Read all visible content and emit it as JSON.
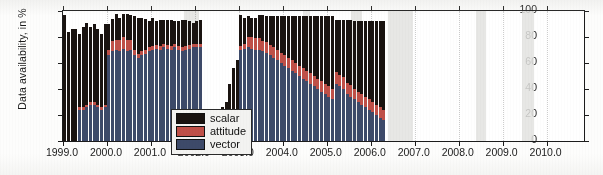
{
  "chart_data": {
    "type": "bar",
    "title": "",
    "subtitle": "",
    "xlabel": "",
    "ylabel": "Data availability, in %",
    "stacked": true,
    "grid": false,
    "legend_position": "inside-lower-left",
    "xlim": [
      1999.0,
      2010.85
    ],
    "ylim": [
      0,
      100
    ],
    "xticks": [
      "1999.0",
      "2000.0",
      "2001.0",
      "2002.0",
      "2003.0",
      "2004.0",
      "2005.0",
      "2006.0",
      "2007.0",
      "2008.0",
      "2009.0",
      "2010.0"
    ],
    "xtick_values": [
      1999.0,
      2000.0,
      2001.0,
      2002.0,
      2003.0,
      2004.0,
      2005.0,
      2006.0,
      2007.0,
      2008.0,
      2009.0,
      2010.0
    ],
    "yticks": [
      "0",
      "20",
      "40",
      "60",
      "80",
      "100"
    ],
    "ytick_values": [
      0,
      20,
      40,
      60,
      80,
      100
    ],
    "legend": [
      {
        "label": "scalar",
        "color": "#191310"
      },
      {
        "label": "attitude",
        "color": "#bf5048"
      },
      {
        "label": "vector",
        "color": "#3d4a69"
      }
    ],
    "series_order": [
      "vector",
      "attitude",
      "scalar"
    ],
    "x": [
      1999.0,
      1999.08,
      1999.17,
      1999.25,
      1999.33,
      1999.42,
      1999.5,
      1999.58,
      1999.67,
      1999.75,
      1999.83,
      1999.92,
      2000.0,
      2000.08,
      2000.17,
      2000.25,
      2000.33,
      2000.42,
      2000.5,
      2000.58,
      2000.67,
      2000.75,
      2000.83,
      2000.92,
      2001.0,
      2001.08,
      2001.17,
      2001.25,
      2001.33,
      2001.42,
      2001.5,
      2001.58,
      2001.67,
      2001.75,
      2001.83,
      2001.92,
      2002.0,
      2002.08,
      2002.17,
      2002.25,
      2002.33,
      2002.42,
      2002.5,
      2002.58,
      2002.67,
      2002.75,
      2002.83,
      2002.92,
      2003.0,
      2003.08,
      2003.17,
      2003.25,
      2003.33,
      2003.42,
      2003.5,
      2003.58,
      2003.67,
      2003.75,
      2003.83,
      2003.92,
      2004.0,
      2004.08,
      2004.17,
      2004.25,
      2004.33,
      2004.42,
      2004.5,
      2004.58,
      2004.67,
      2004.75,
      2004.83,
      2004.92,
      2005.0,
      2005.08,
      2005.17,
      2005.25,
      2005.33,
      2005.42,
      2005.5,
      2005.58,
      2005.67,
      2005.75,
      2005.83,
      2005.92,
      2006.0,
      2006.08,
      2006.17,
      2006.25,
      2006.33,
      2006.42,
      2006.5,
      2006.58,
      2006.67,
      2006.75,
      2006.83,
      2006.92,
      2007.0,
      2007.08,
      2007.17,
      2007.25,
      2007.33,
      2007.42,
      2007.5,
      2007.58,
      2007.67,
      2007.75,
      2007.83,
      2007.92,
      2008.0,
      2008.08,
      2008.17,
      2008.25,
      2008.33,
      2008.42,
      2008.5,
      2008.58,
      2008.67,
      2008.75,
      2008.83,
      2008.92,
      2009.0,
      2009.08,
      2009.17,
      2009.25,
      2009.33,
      2009.42,
      2009.5,
      2009.58,
      2009.67,
      2009.75,
      2009.83,
      2009.92,
      2010.0,
      2010.08,
      2010.17,
      2010.25,
      2010.33,
      2010.42,
      2010.5,
      2010.58,
      2010.67,
      2010.75
    ],
    "series": [
      {
        "name": "vector",
        "color": "#3d4a69",
        "values": [
          0,
          0,
          0,
          0,
          24,
          24,
          26,
          28,
          28,
          26,
          24,
          26,
          66,
          69,
          70,
          69,
          71,
          69,
          70,
          66,
          64,
          66,
          67,
          69,
          70,
          71,
          70,
          72,
          71,
          70,
          72,
          70,
          69,
          70,
          71,
          72,
          72,
          72,
          0,
          0,
          0,
          0,
          0,
          0,
          0,
          0,
          0,
          0,
          70,
          71,
          72,
          71,
          70,
          70,
          69,
          68,
          66,
          64,
          62,
          60,
          58,
          56,
          54,
          52,
          50,
          48,
          46,
          44,
          42,
          40,
          38,
          36,
          34,
          32,
          44,
          42,
          40,
          36,
          34,
          32,
          30,
          28,
          26,
          24,
          22,
          20,
          18,
          16,
          0,
          0,
          0,
          0,
          0,
          0,
          0,
          0,
          0,
          0,
          0,
          0,
          0,
          0,
          0,
          0,
          0,
          0,
          0,
          0,
          0,
          0,
          0,
          0,
          0,
          0,
          0,
          0,
          0,
          0,
          0,
          0,
          0,
          0,
          0,
          0,
          0,
          0,
          0,
          0,
          0,
          0,
          0,
          0,
          0,
          0,
          0,
          0,
          0,
          0,
          0,
          0,
          0,
          0
        ]
      },
      {
        "name": "attitude",
        "color": "#bf5048",
        "values": [
          0,
          0,
          0,
          0,
          2,
          2,
          2,
          2,
          2,
          2,
          2,
          2,
          4,
          8,
          8,
          9,
          9,
          9,
          8,
          4,
          3,
          3,
          3,
          3,
          3,
          3,
          3,
          3,
          3,
          3,
          3,
          3,
          3,
          3,
          3,
          3,
          3,
          3,
          0,
          0,
          0,
          0,
          0,
          0,
          0,
          0,
          0,
          0,
          3,
          4,
          8,
          9,
          9,
          9,
          8,
          8,
          8,
          8,
          8,
          8,
          8,
          8,
          8,
          8,
          8,
          8,
          8,
          8,
          8,
          8,
          8,
          8,
          8,
          8,
          9,
          9,
          9,
          9,
          9,
          8,
          8,
          8,
          8,
          8,
          8,
          8,
          8,
          8,
          0,
          0,
          0,
          0,
          0,
          0,
          0,
          0,
          0,
          0,
          0,
          0,
          0,
          0,
          0,
          0,
          0,
          0,
          0,
          0,
          0,
          0,
          0,
          0,
          0,
          0,
          0,
          0,
          0,
          0,
          0,
          0,
          0,
          0,
          0,
          0,
          0,
          0,
          0,
          0,
          0,
          0,
          0,
          0,
          0,
          0,
          0,
          0,
          0,
          0,
          0,
          0,
          0,
          0
        ]
      },
      {
        "name": "scalar",
        "color": "#191310",
        "values": [
          97,
          84,
          86,
          86,
          56,
          62,
          63,
          58,
          60,
          58,
          56,
          62,
          20,
          17,
          20,
          17,
          18,
          20,
          19,
          26,
          28,
          26,
          24,
          20,
          22,
          18,
          20,
          18,
          19,
          20,
          17,
          19,
          21,
          20,
          18,
          16,
          17,
          18,
          0,
          0,
          0,
          0,
          0,
          26,
          30,
          44,
          56,
          62,
          24,
          20,
          16,
          15,
          16,
          18,
          20,
          20,
          22,
          24,
          26,
          28,
          30,
          32,
          34,
          36,
          38,
          40,
          42,
          44,
          46,
          48,
          50,
          52,
          54,
          56,
          40,
          42,
          44,
          48,
          50,
          52,
          54,
          56,
          58,
          60,
          62,
          64,
          66,
          68,
          0,
          0,
          0,
          0,
          0,
          0,
          0,
          0,
          0,
          0,
          0,
          0,
          0,
          0,
          0,
          0,
          0,
          0,
          0,
          0,
          0,
          0,
          0,
          0,
          0,
          0,
          0,
          0,
          0,
          0,
          0,
          0,
          0,
          0,
          0,
          0,
          0,
          0,
          0,
          0,
          0,
          0,
          0,
          0,
          0,
          0,
          0,
          0,
          0,
          0,
          0,
          0,
          0,
          0
        ]
      }
    ],
    "gaps": [
      {
        "from": 2002.15,
        "to": 2002.55,
        "note": "no data"
      },
      {
        "from": 2006.35,
        "to": 2006.95,
        "note": "no data"
      },
      {
        "from": 2009.45,
        "to": 2009.7,
        "note": "no data"
      }
    ]
  },
  "figure": {
    "ylabel": "Data availability, in %"
  }
}
